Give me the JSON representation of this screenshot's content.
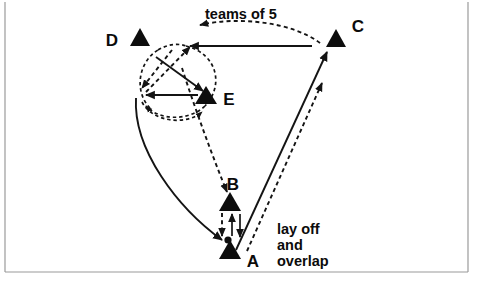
{
  "figure": {
    "title_text": "",
    "background": "#ffffff",
    "ink_color": "#121212",
    "frame_color": "#9a9a9a",
    "width": 484,
    "height": 286
  },
  "players": [
    {
      "id": "D",
      "label": "D",
      "x": 140,
      "y": 40,
      "label_x": 112,
      "label_y": 40
    },
    {
      "id": "C",
      "label": "C",
      "x": 336,
      "y": 41,
      "label_x": 358,
      "label_y": 28
    },
    {
      "id": "E",
      "label": "E",
      "x": 206,
      "y": 98,
      "label_x": 223,
      "label_y": 101
    },
    {
      "id": "B",
      "label": "B",
      "x": 230,
      "y": 203,
      "label_x": 231,
      "label_y": 190
    },
    {
      "id": "A",
      "label": "A",
      "x": 230,
      "y": 258,
      "label_x": 249,
      "label_y": 264
    }
  ],
  "ball": {
    "x": 228,
    "y": 240,
    "r": 3.6
  },
  "annotations": [
    {
      "name": "teams-of-5",
      "text": "teams of 5",
      "x": 205,
      "y": 18
    },
    {
      "name": "lay-off",
      "text": "lay off",
      "x": 277,
      "y": 234
    },
    {
      "name": "and",
      "text": "and",
      "x": 277,
      "y": 250
    },
    {
      "name": "overlap",
      "text": "overlap",
      "x": 277,
      "y": 266
    }
  ],
  "movements": {
    "solid_label": "player run (solid)",
    "dashed_label": "ball pass (dashed)",
    "items": [
      {
        "name": "run-e-to-c",
        "style": "solid"
      },
      {
        "name": "run-d-to-e",
        "style": "solid"
      },
      {
        "name": "run-e-to-d",
        "style": "solid"
      },
      {
        "name": "run-e-to-a",
        "style": "solid"
      },
      {
        "name": "run-a-to-c",
        "style": "solid"
      },
      {
        "name": "pass-c-to-d",
        "style": "dashed"
      },
      {
        "name": "pass-d-loop",
        "style": "dashed"
      },
      {
        "name": "pass-e-loop",
        "style": "dashed"
      },
      {
        "name": "pass-e-to-b",
        "style": "dashed"
      },
      {
        "name": "pass-a-to-b",
        "style": "dashed"
      },
      {
        "name": "pass-b-to-a",
        "style": "solid"
      },
      {
        "name": "pass-a-to-c",
        "style": "dashed"
      }
    ]
  }
}
